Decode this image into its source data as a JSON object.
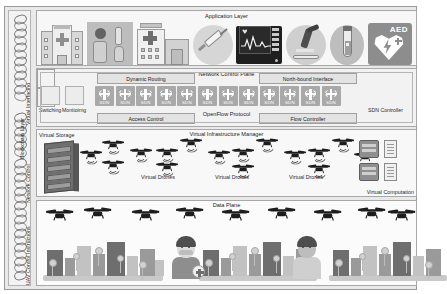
{
  "figure": {
    "background": "#e9e9e9"
  },
  "rail": {
    "labels": [
      {
        "text": "Virtual Interfacing"
      },
      {
        "text": "Blockchain Layer"
      },
      {
        "text": "Network Control"
      },
      {
        "text": "UAV Control Instructions"
      }
    ]
  },
  "application_layer": {
    "title": "Application Layer",
    "icons": [
      {
        "name": "hospital-icon",
        "label": "hospital"
      },
      {
        "name": "medical-equipment-icon",
        "label": "medical equipment"
      },
      {
        "name": "clinic-icon",
        "label": "clinic"
      },
      {
        "name": "syringe-icon",
        "label": "syringe"
      },
      {
        "name": "ecg-monitor-icon",
        "label": "ECG monitor"
      },
      {
        "name": "microscope-icon",
        "label": "microscope"
      },
      {
        "name": "blood-vial-icon",
        "label": "blood vial"
      },
      {
        "name": "aed-icon",
        "label": "AED",
        "text": "AED"
      }
    ]
  },
  "network_control_plane": {
    "title": "Network Control Plane",
    "dynamic_routing": "Dynamic Routing",
    "north_bound_interface": "North-bound Interface",
    "access_control": "Access Control",
    "flow_controller": "Flow Controller",
    "openflow_protocol": "OpenFlow Protocol",
    "switching_label": "Switching",
    "monitoring_label": "Monitoirng",
    "sdn_controller_label": "SDN Controller",
    "sdn_switch_label": "SDN",
    "sdn_switch_count": 12
  },
  "virtual_infrastructure_manager": {
    "title": "Virtual Infrastructure Manager",
    "virtual_storage": "Virtual Storage",
    "virtual_computation": "Virtual Computation",
    "virtual_drones_labels": [
      "Virtual Drones",
      "Virtual Drones",
      "Virtual Drones"
    ],
    "drone_count": 14
  },
  "data_plane": {
    "title": "Data Plane",
    "drone_count": 8,
    "city_count": 3,
    "people": [
      {
        "name": "patient-sick",
        "state": "sick"
      },
      {
        "name": "patient-healthy",
        "state": "healthy"
      }
    ]
  },
  "colors": {
    "frame": "#e9e9e9",
    "panel": "#fdfdfd",
    "border": "#a8a8a8",
    "sdn": "#a9a9a9",
    "text": "#1c1c1c"
  }
}
